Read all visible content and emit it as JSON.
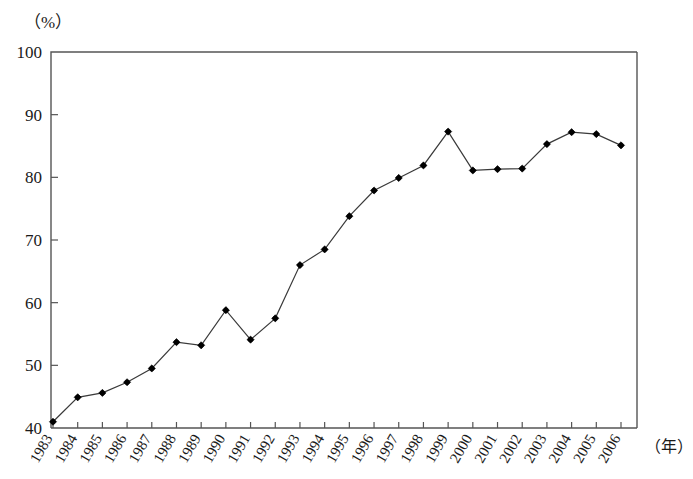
{
  "chart_data": {
    "type": "line",
    "title": "",
    "subtitle": "",
    "xlabel": "（年）",
    "ylabel": "（%）",
    "ylim": [
      40,
      100
    ],
    "ytick_labels": [
      "100",
      "90",
      "80",
      "70",
      "60",
      "50",
      "40"
    ],
    "yticks": [
      100,
      90,
      80,
      70,
      60,
      50,
      40
    ],
    "grid": false,
    "legend": null,
    "marker": "diamond",
    "line_color": "#3a3a3a",
    "marker_color": "#000000",
    "categories": [
      "1983",
      "1984",
      "1985",
      "1986",
      "1987",
      "1988",
      "1989",
      "1990",
      "1991",
      "1992",
      "1993",
      "1994",
      "1995",
      "1996",
      "1997",
      "1998",
      "1999",
      "2000",
      "2001",
      "2002",
      "2003",
      "2004",
      "2005",
      "2006"
    ],
    "values": [
      41.0,
      44.9,
      45.6,
      47.3,
      49.5,
      53.7,
      53.2,
      58.8,
      54.1,
      57.5,
      66.0,
      68.5,
      73.8,
      77.9,
      79.9,
      81.9,
      87.3,
      81.1,
      81.3,
      81.4,
      85.3,
      87.2,
      86.9,
      85.1
    ],
    "series": [
      {
        "name": "",
        "values": [
          41.0,
          44.9,
          45.6,
          47.3,
          49.5,
          53.7,
          53.2,
          58.8,
          54.1,
          57.5,
          66.0,
          68.5,
          73.8,
          77.9,
          79.9,
          81.9,
          87.3,
          81.1,
          81.3,
          81.4,
          85.3,
          87.2,
          86.9,
          85.1
        ]
      }
    ],
    "annotations": []
  }
}
